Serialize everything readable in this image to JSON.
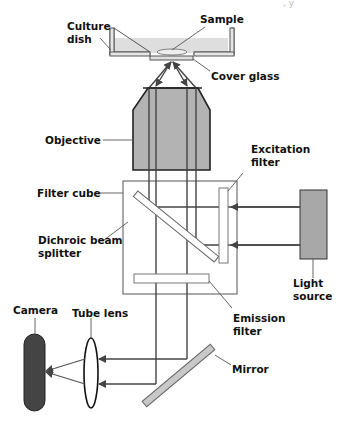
{
  "diagram": {
    "clipped_header_fragment": ", y",
    "colors": {
      "stroke": "#333333",
      "beam": "#444444",
      "objective_fill": "#b3b3b3",
      "light_source_fill": "#a8a8a8",
      "camera_fill": "#444444",
      "dish_fill": "#e0e0e0",
      "filter_fill": "#ffffff",
      "mirror_fill": "#c8c8c8"
    },
    "labels": {
      "culture_dish_1": "Culture",
      "culture_dish_2": "dish",
      "sample": "Sample",
      "cover_glass": "Cover glass",
      "objective": "Objective",
      "excitation_filter_1": "Excitation",
      "excitation_filter_2": "filter",
      "filter_cube": "Filter cube",
      "dichroic_1": "Dichroic beam",
      "dichroic_2": "splitter",
      "light_source_1": "Light",
      "light_source_2": "source",
      "emission_filter_1": "Emission",
      "emission_filter_2": "filter",
      "camera": "Camera",
      "tube_lens": "Tube lens",
      "mirror": "Mirror"
    },
    "components": [
      "Culture dish",
      "Sample",
      "Cover glass",
      "Objective",
      "Filter cube",
      "Excitation filter",
      "Dichroic beam splitter",
      "Light source",
      "Emission filter",
      "Mirror",
      "Tube lens",
      "Camera"
    ]
  }
}
